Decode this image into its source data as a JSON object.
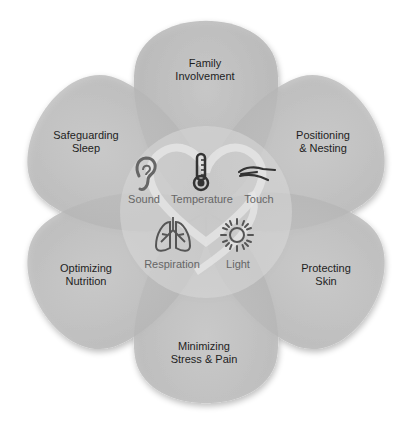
{
  "diagram": {
    "type": "flower-venn",
    "petals": [
      {
        "id": "top",
        "line1": "Family",
        "line2": "Involvement"
      },
      {
        "id": "top-right",
        "line1": "Positioning",
        "line2": "& Nesting"
      },
      {
        "id": "bottom-right",
        "line1": "Protecting",
        "line2": "Skin"
      },
      {
        "id": "bottom",
        "line1": "Minimizing",
        "line2": "Stress & Pain"
      },
      {
        "id": "bottom-left",
        "line1": "Optimizing",
        "line2": "Nutrition"
      },
      {
        "id": "top-left",
        "line1": "Safeguarding",
        "line2": "Sleep"
      }
    ],
    "senses": [
      {
        "label": "Sound",
        "icon": "ear-icon"
      },
      {
        "label": "Temperature",
        "icon": "thermometer-icon"
      },
      {
        "label": "Touch",
        "icon": "hand-icon"
      },
      {
        "label": "Respiration",
        "icon": "lungs-icon"
      },
      {
        "label": "Light",
        "icon": "sun-icon"
      }
    ],
    "colors": {
      "petal": "#bdbdbd",
      "overlap": "#a9a9a9",
      "center": "#cfcfcf",
      "icon": "#555555",
      "text": "#1e1e1e",
      "sense_text": "#666666"
    }
  }
}
